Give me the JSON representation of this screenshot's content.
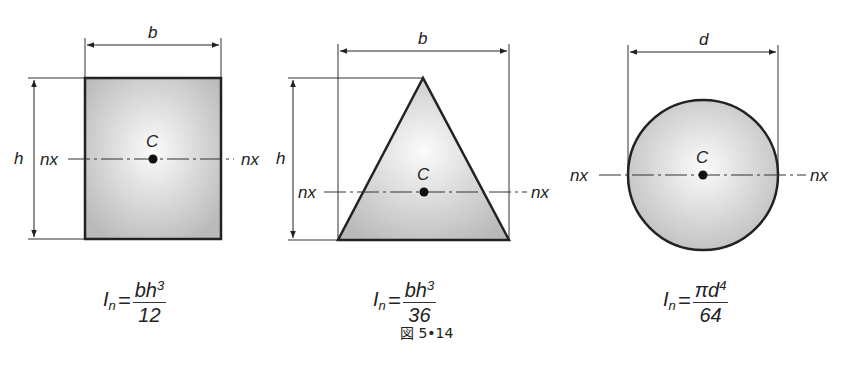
{
  "figure": {
    "caption": "図 5•14",
    "shapes": [
      {
        "type": "rectangle",
        "width_label": "b",
        "height_label": "h",
        "centroid_label": "C",
        "axis_label_left": "nx",
        "axis_label_right": "nx",
        "formula": {
          "lhs": "I",
          "lhs_sub": "n",
          "eq": "=",
          "num": "bh",
          "num_sup": "3",
          "den": "12"
        }
      },
      {
        "type": "triangle",
        "width_label": "b",
        "height_label": "h",
        "centroid_label": "C",
        "axis_label_left": "nx",
        "axis_label_right": "nx",
        "formula": {
          "lhs": "I",
          "lhs_sub": "n",
          "eq": "=",
          "num": "bh",
          "num_sup": "3",
          "den": "36"
        }
      },
      {
        "type": "circle",
        "width_label": "d",
        "centroid_label": "C",
        "axis_label_left": "nx",
        "axis_label_right": "nx",
        "formula": {
          "lhs": "I",
          "lhs_sub": "n",
          "eq": "=",
          "num": "πd",
          "num_sup": "4",
          "den": "64"
        }
      }
    ]
  }
}
